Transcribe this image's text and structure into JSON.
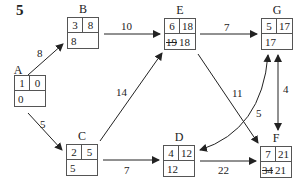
{
  "question_number": "5",
  "nodes": {
    "A": {
      "label": "A",
      "activity": "1",
      "duration": "0",
      "lft": "0",
      "lft_old": ""
    },
    "B": {
      "label": "B",
      "activity": "3",
      "duration": "8",
      "lft": "8",
      "lft_old": ""
    },
    "C": {
      "label": "C",
      "activity": "2",
      "duration": "5",
      "lft": "5",
      "lft_old": ""
    },
    "D": {
      "label": "D",
      "activity": "4",
      "duration": "12",
      "lft": "12",
      "lft_old": ""
    },
    "E": {
      "label": "E",
      "activity": "6",
      "duration": "18",
      "lft": "18",
      "lft_old": "19"
    },
    "F": {
      "label": "F",
      "activity": "7",
      "duration": "21",
      "lft": "21",
      "lft_old": "34"
    },
    "G": {
      "label": "G",
      "activity": "5",
      "duration": "17",
      "lft": "17",
      "lft_old": ""
    }
  },
  "edges": [
    {
      "from": "A",
      "to": "B",
      "weight": "8"
    },
    {
      "from": "A",
      "to": "C",
      "weight": "5"
    },
    {
      "from": "B",
      "to": "E",
      "weight": "10"
    },
    {
      "from": "C",
      "to": "E",
      "weight": "14"
    },
    {
      "from": "C",
      "to": "D",
      "weight": "7"
    },
    {
      "from": "E",
      "to": "G",
      "weight": "7"
    },
    {
      "from": "E",
      "to": "F",
      "weight": "11"
    },
    {
      "from": "D",
      "to": "F",
      "weight": "22"
    },
    {
      "from": "D",
      "to": "G",
      "weight": "5",
      "bidirectional": true,
      "curved": true
    },
    {
      "from": "G",
      "to": "F",
      "weight": "4",
      "bidirectional": true
    }
  ],
  "colors": {
    "line": "#222222",
    "box_border": "#555555",
    "background": "#ffffff"
  }
}
